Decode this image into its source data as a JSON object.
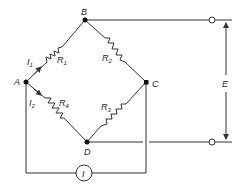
{
  "diagram": {
    "type": "wheatstone-bridge",
    "nodes": {
      "A": "A",
      "B": "B",
      "C": "C",
      "D": "D"
    },
    "resistors": {
      "R1": {
        "label": "R",
        "sub": "1"
      },
      "R2": {
        "label": "R",
        "sub": "2"
      },
      "R3": {
        "label": "R",
        "sub": "3"
      },
      "R4": {
        "label": "R",
        "sub": "4"
      }
    },
    "currents": {
      "I1": {
        "label": "I",
        "sub": "1"
      },
      "I2": {
        "label": "I",
        "sub": "2"
      }
    },
    "meter": {
      "label": "I"
    },
    "voltage": {
      "label": "E"
    }
  }
}
